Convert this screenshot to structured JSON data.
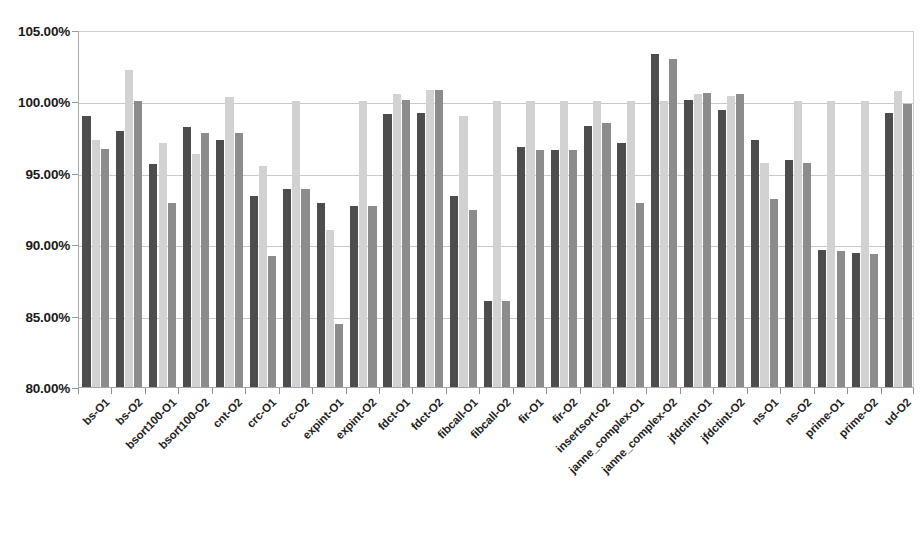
{
  "chart_data": {
    "type": "bar",
    "title": "",
    "subtitle": "",
    "xlabel": "",
    "ylabel": "",
    "ylim": [
      80,
      105
    ],
    "ytick_labels": [
      "105.00%",
      "100.00%",
      "95.00%",
      "90.00%",
      "85.00%",
      "80.00%"
    ],
    "ytick_values": [
      105,
      100,
      95,
      90,
      85,
      80
    ],
    "grid": true,
    "legend": "none",
    "colors": {
      "series1": "#4d4d4d",
      "series2": "#d2d2d2",
      "series3": "#8c8c8c",
      "gridline": "#c9c9c9",
      "axis": "#a6a6a6",
      "background": "#ffffff"
    },
    "categories": [
      "bs-O1",
      "bs-O2",
      "bsort100-O1",
      "bsort100-O2",
      "cnt-O2",
      "crc-O1",
      "crc-O2",
      "expint-O1",
      "expint-O2",
      "fdct-O1",
      "fdct-O2",
      "fibcall-O1",
      "fibcall-O2",
      "fir-O1",
      "fir-O2",
      "insertsort-O2",
      "janne_complex-O1",
      "janne_complex-O2",
      "jfdctint-O1",
      "jfdctint-O2",
      "ns-O1",
      "ns-O2",
      "prime-O1",
      "prime-O2",
      "ud-O2"
    ],
    "series": [
      {
        "name": "series1",
        "values": [
          99.0,
          97.9,
          95.6,
          98.2,
          97.3,
          93.4,
          93.9,
          92.9,
          92.7,
          99.1,
          99.2,
          93.4,
          86.0,
          96.8,
          96.6,
          98.3,
          97.1,
          103.3,
          100.1,
          99.4,
          97.3,
          95.9,
          89.6,
          89.4,
          99.2
        ]
      },
      {
        "name": "series2",
        "values": [
          97.3,
          102.2,
          97.1,
          96.3,
          100.3,
          95.5,
          100.0,
          91.0,
          100.0,
          100.5,
          100.8,
          99.0,
          100.0,
          100.0,
          100.0,
          100.0,
          100.0,
          100.0,
          100.5,
          100.4,
          95.7,
          100.0,
          100.0,
          100.0,
          100.7
        ]
      },
      {
        "name": "series3",
        "values": [
          96.7,
          100.0,
          92.9,
          97.8,
          97.8,
          89.2,
          93.9,
          84.4,
          92.7,
          100.1,
          100.8,
          92.4,
          86.0,
          96.6,
          96.6,
          98.5,
          92.9,
          103.0,
          100.6,
          100.5,
          93.2,
          95.7,
          89.5,
          89.3,
          99.8
        ]
      }
    ]
  }
}
